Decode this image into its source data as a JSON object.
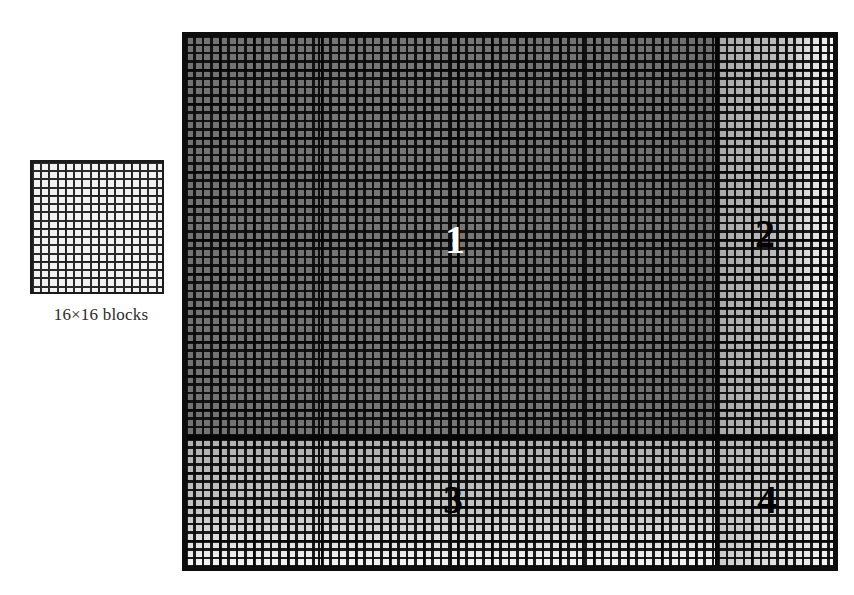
{
  "figure": {
    "type": "grid-partition-diagram"
  },
  "legend": {
    "caption": "16×16 blocks",
    "rows": 16,
    "cols": 16,
    "icon_name": "block-grid-sample"
  },
  "main_grid": {
    "block_size_label": "16×16",
    "columns": 76,
    "rows": 62,
    "border_color": "#0d0d0d",
    "regions": [
      {
        "id": "1",
        "label": "1",
        "label_color": "#ffffff",
        "shade": "#737373",
        "position": "top-left",
        "x_pct": 0.0,
        "y_pct": 0.0,
        "w_pct": 0.805,
        "h_pct": 0.752
      },
      {
        "id": "2",
        "label": "2",
        "label_color": "#000000",
        "shade": "#c6c6c6",
        "position": "top-right",
        "x_pct": 0.805,
        "y_pct": 0.0,
        "w_pct": 0.195,
        "h_pct": 0.752
      },
      {
        "id": "3",
        "label": "3",
        "label_color": "#000000",
        "shade": "#c9c9c9",
        "position": "bottom-left",
        "x_pct": 0.0,
        "y_pct": 0.752,
        "w_pct": 0.805,
        "h_pct": 0.248
      },
      {
        "id": "4",
        "label": "4",
        "label_color": "#000000",
        "shade": "#cccccc",
        "position": "bottom-right",
        "x_pct": 0.805,
        "y_pct": 0.752,
        "w_pct": 0.195,
        "h_pct": 0.248
      }
    ]
  },
  "colors": {
    "background": "#ffffff",
    "grid_line": "#0a0a0a",
    "caption_text": "#2b2b2b"
  }
}
